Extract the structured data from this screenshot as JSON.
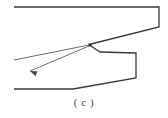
{
  "figure": {
    "caption": "( c )",
    "type": "technical-line-drawing",
    "colors": {
      "stroke": "#3a3a3a",
      "stroke_light": "#6e6e6e",
      "background": "#ffffff",
      "caption": "#4a4a4a"
    },
    "stroke_width": 1.2,
    "canvas": {
      "width": 168,
      "height": 118
    }
  },
  "drawing_data": {
    "type": "polyline-set",
    "description": "Upper body outline, lower body outline with step, notch vertex and two leader lines with arrowhead",
    "paths": [
      {
        "name": "upper-body-outline",
        "points": [
          [
            14,
            7
          ],
          [
            159,
            7
          ],
          [
            159,
            27
          ],
          [
            91,
            44
          ]
        ],
        "closed": false,
        "stroke": "#3a3a3a"
      },
      {
        "name": "lower-body-outline",
        "points": [
          [
            91,
            46
          ],
          [
            100,
            52
          ],
          [
            136,
            53
          ],
          [
            136,
            78
          ],
          [
            73,
            89
          ],
          [
            14,
            89
          ]
        ],
        "closed": false,
        "stroke": "#3a3a3a"
      },
      {
        "name": "leader-line-upper",
        "points": [
          [
            14,
            60
          ],
          [
            89,
            45
          ]
        ],
        "closed": false,
        "stroke": "#6e6e6e"
      },
      {
        "name": "leader-line-arrow",
        "points": [
          [
            89,
            46
          ],
          [
            30,
            71
          ]
        ],
        "closed": false,
        "stroke": "#6e6e6e"
      }
    ],
    "markers": [
      {
        "name": "notch-vertex-marker",
        "x": 90,
        "y": 45,
        "shape": "square",
        "size": 3
      },
      {
        "name": "arrowhead-marker",
        "x": 30,
        "y": 71,
        "shape": "triangle",
        "angle": 203
      }
    ]
  }
}
